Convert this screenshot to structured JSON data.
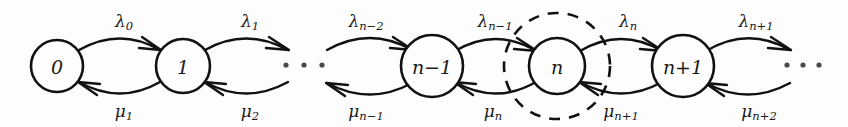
{
  "diagram": {
    "type": "markov-chain-state-diagram",
    "colors": {
      "stroke": "#111111",
      "node_fill": "#fefefe",
      "background": "#fdfdfd",
      "dot": "#4a4a4a"
    },
    "states": [
      {
        "id": "state-0",
        "label": "0",
        "base": "0",
        "cx": 57,
        "cy": 66,
        "r": 26
      },
      {
        "id": "state-1",
        "label": "1",
        "base": "1",
        "cx": 183,
        "cy": 66,
        "r": 27
      },
      {
        "id": "state-nm1",
        "label": "n−1",
        "base": "n",
        "op": "−",
        "suffix": "1",
        "cx": 432,
        "cy": 66,
        "r": 31
      },
      {
        "id": "state-n",
        "label": "n",
        "base": "n",
        "cx": 557,
        "cy": 66,
        "r": 28
      },
      {
        "id": "state-np1",
        "label": "n+1",
        "base": "n",
        "op": "+",
        "suffix": "1",
        "cx": 683,
        "cy": 66,
        "r": 31
      }
    ],
    "cut": {
      "id": "cut-boundary",
      "label": "cut-boundary-around-state-n",
      "cx": 557,
      "cy": 66,
      "r": 53,
      "style": "dashed"
    },
    "birth_rates": [
      {
        "id": "lambda-0",
        "symbol": "λ",
        "subscript": "0",
        "x": 124,
        "y": 21
      },
      {
        "id": "lambda-1",
        "symbol": "λ",
        "subscript": "1",
        "x": 250,
        "y": 21
      },
      {
        "id": "lambda-nm2",
        "symbol": "λ",
        "subscript": "n−2",
        "x": 366,
        "y": 21
      },
      {
        "id": "lambda-nm1",
        "symbol": "λ",
        "subscript": "n−1",
        "x": 495,
        "y": 21
      },
      {
        "id": "lambda-n",
        "symbol": "λ",
        "subscript": "n",
        "x": 628,
        "y": 21
      },
      {
        "id": "lambda-np1",
        "symbol": "λ",
        "subscript": "n+1",
        "x": 756,
        "y": 21
      }
    ],
    "death_rates": [
      {
        "id": "mu-1",
        "symbol": "μ",
        "subscript": "1",
        "x": 124,
        "y": 111
      },
      {
        "id": "mu-2",
        "symbol": "μ",
        "subscript": "2",
        "x": 250,
        "y": 111
      },
      {
        "id": "mu-nm1",
        "symbol": "μ",
        "subscript": "n−1",
        "x": 366,
        "y": 111
      },
      {
        "id": "mu-n",
        "symbol": "μ",
        "subscript": "n",
        "x": 493,
        "y": 111
      },
      {
        "id": "mu-np1",
        "symbol": "μ",
        "subscript": "n+1",
        "x": 621,
        "y": 111
      },
      {
        "id": "mu-np2",
        "symbol": "μ",
        "subscript": "n+2",
        "x": 759,
        "y": 111
      }
    ],
    "ellipses": [
      {
        "id": "ellipsis-left",
        "dots": [
          286,
          304,
          322
        ],
        "cy": 65,
        "r": 2.6
      },
      {
        "id": "ellipsis-right",
        "dots": [
          787,
          803,
          819
        ],
        "cy": 65,
        "r": 2.6
      }
    ],
    "transitions": [
      {
        "id": "t-0-to-1",
        "from": "0",
        "to": "1",
        "direction": "forward",
        "rate": "λ0"
      },
      {
        "id": "t-1-to-0",
        "from": "1",
        "to": "0",
        "direction": "backward",
        "rate": "μ1"
      },
      {
        "id": "t-1-to-next",
        "from": "1",
        "to": "…",
        "direction": "forward",
        "rate": "λ1"
      },
      {
        "id": "t-next-to-1",
        "from": "…",
        "to": "1",
        "direction": "backward",
        "rate": "μ2"
      },
      {
        "id": "t-prev-to-nm1",
        "from": "…",
        "to": "n−1",
        "direction": "forward",
        "rate": "λn−2"
      },
      {
        "id": "t-nm1-to-prev",
        "from": "n−1",
        "to": "…",
        "direction": "backward",
        "rate": "μn−1"
      },
      {
        "id": "t-nm1-to-n",
        "from": "n−1",
        "to": "n",
        "direction": "forward",
        "rate": "λn−1"
      },
      {
        "id": "t-n-to-nm1",
        "from": "n",
        "to": "n−1",
        "direction": "backward",
        "rate": "μn"
      },
      {
        "id": "t-n-to-np1",
        "from": "n",
        "to": "n+1",
        "direction": "forward",
        "rate": "λn"
      },
      {
        "id": "t-np1-to-n",
        "from": "n+1",
        "to": "n",
        "direction": "backward",
        "rate": "μn+1"
      },
      {
        "id": "t-np1-to-next",
        "from": "n+1",
        "to": "…",
        "direction": "forward",
        "rate": "λn+1"
      },
      {
        "id": "t-next-to-np1",
        "from": "…",
        "to": "n+1",
        "direction": "backward",
        "rate": "μn+2"
      }
    ]
  }
}
